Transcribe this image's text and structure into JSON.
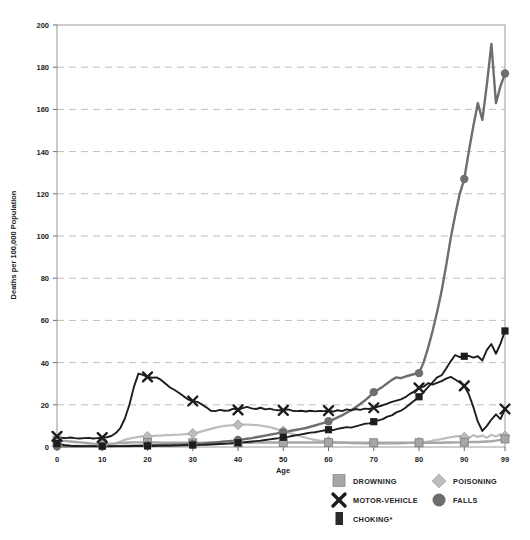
{
  "chart_data": {
    "type": "line",
    "title": "",
    "xlabel": "Age",
    "ylabel": "Deaths per 100,000 Population",
    "xlim": [
      0,
      99
    ],
    "ylim": [
      0,
      200
    ],
    "xticks": [
      0,
      10,
      20,
      30,
      40,
      50,
      60,
      70,
      80,
      90,
      99
    ],
    "yticks": [
      0,
      20,
      40,
      60,
      80,
      100,
      120,
      140,
      160,
      180,
      200
    ],
    "grid": "horizontal-dashed",
    "legend_position": "bottom",
    "x": [
      0,
      1,
      2,
      3,
      4,
      5,
      6,
      7,
      8,
      9,
      10,
      11,
      12,
      13,
      14,
      15,
      16,
      17,
      18,
      19,
      20,
      21,
      22,
      23,
      24,
      25,
      26,
      27,
      28,
      29,
      30,
      31,
      32,
      33,
      34,
      35,
      36,
      37,
      38,
      39,
      40,
      41,
      42,
      43,
      44,
      45,
      46,
      47,
      48,
      49,
      50,
      51,
      52,
      53,
      54,
      55,
      56,
      57,
      58,
      59,
      60,
      61,
      62,
      63,
      64,
      65,
      66,
      67,
      68,
      69,
      70,
      71,
      72,
      73,
      74,
      75,
      76,
      77,
      78,
      79,
      80,
      81,
      82,
      83,
      84,
      85,
      86,
      87,
      88,
      89,
      90,
      91,
      92,
      93,
      94,
      95,
      96,
      97,
      98,
      99
    ],
    "series": [
      {
        "name": "DROWNING",
        "marker": "square",
        "color": "#a6a6a6",
        "marker_ages": [
          0,
          10,
          20,
          30,
          40,
          50,
          60,
          70,
          80,
          90,
          99
        ],
        "values": [
          3.2,
          3.0,
          2.8,
          2.6,
          2.4,
          2.2,
          2.0,
          1.8,
          1.6,
          1.5,
          1.5,
          1.5,
          1.6,
          1.7,
          1.9,
          2.0,
          2.1,
          2.2,
          2.2,
          2.2,
          2.2,
          2.1,
          2.1,
          2.0,
          2.0,
          2.0,
          2.0,
          2.0,
          2.0,
          2.0,
          2.0,
          2.0,
          2.0,
          2.0,
          2.0,
          2.0,
          2.0,
          2.0,
          2.0,
          2.0,
          2.0,
          2.0,
          2.0,
          2.0,
          2.1,
          2.1,
          2.1,
          2.1,
          2.1,
          2.1,
          2.1,
          2.1,
          2.1,
          2.1,
          2.1,
          2.1,
          2.1,
          2.1,
          2.1,
          2.1,
          2.1,
          2.1,
          2.1,
          2.1,
          2.1,
          2.0,
          2.0,
          2.0,
          2.0,
          2.0,
          2.0,
          2.0,
          2.0,
          2.0,
          2.0,
          2.0,
          2.0,
          2.0,
          2.0,
          2.0,
          2.0,
          2.0,
          2.0,
          2.0,
          2.0,
          2.0,
          2.1,
          2.1,
          2.2,
          2.2,
          2.3,
          2.3,
          2.4,
          2.4,
          2.5,
          2.6,
          2.7,
          3.0,
          3.4,
          3.8
        ]
      },
      {
        "name": "MOTOR-VEHICLE",
        "marker": "x",
        "color": "#1d1d1d",
        "marker_ages": [
          0,
          10,
          20,
          30,
          40,
          50,
          60,
          70,
          80,
          90,
          99
        ],
        "values": [
          5.0,
          4.4,
          4.2,
          4.5,
          4.2,
          4.0,
          4.2,
          4.3,
          4.0,
          4.2,
          4.4,
          4.6,
          5.2,
          6.6,
          9.0,
          13.5,
          20.0,
          28.5,
          34.8,
          34.2,
          33.2,
          32.8,
          33.0,
          31.8,
          30.0,
          28.2,
          27.0,
          25.6,
          24.0,
          22.5,
          21.8,
          21.4,
          20.2,
          18.8,
          17.2,
          17.0,
          17.6,
          17.2,
          17.3,
          18.2,
          17.6,
          18.4,
          19.0,
          18.3,
          18.0,
          18.6,
          17.8,
          18.2,
          17.6,
          17.4,
          17.4,
          17.8,
          17.2,
          17.0,
          17.2,
          16.8,
          17.2,
          16.9,
          17.1,
          17.0,
          17.2,
          16.8,
          17.4,
          17.0,
          17.8,
          17.4,
          18.0,
          17.6,
          18.2,
          18.0,
          18.6,
          19.2,
          19.8,
          20.6,
          21.4,
          22.0,
          22.6,
          23.6,
          25.2,
          26.4,
          28.0,
          28.6,
          30.2,
          29.6,
          30.4,
          31.2,
          32.4,
          33.2,
          32.0,
          30.6,
          29.0,
          25.0,
          19.0,
          12.0,
          7.6,
          10.0,
          13.0,
          15.5,
          13.2,
          18.0
        ]
      },
      {
        "name": "CHOKING*",
        "marker": "square-dark",
        "color": "#1d1d1d",
        "marker_ages": [
          0,
          10,
          20,
          30,
          40,
          50,
          60,
          70,
          80,
          90,
          99
        ],
        "values": [
          1.6,
          1.2,
          0.8,
          0.6,
          0.5,
          0.4,
          0.4,
          0.4,
          0.4,
          0.4,
          0.4,
          0.4,
          0.4,
          0.4,
          0.4,
          0.4,
          0.5,
          0.5,
          0.5,
          0.5,
          0.5,
          0.5,
          0.6,
          0.6,
          0.6,
          0.6,
          0.7,
          0.7,
          0.8,
          0.8,
          0.9,
          0.9,
          1.0,
          1.1,
          1.2,
          1.3,
          1.4,
          1.5,
          1.6,
          1.8,
          2.0,
          2.2,
          2.4,
          2.6,
          2.8,
          3.0,
          3.3,
          3.6,
          3.9,
          4.2,
          4.6,
          4.8,
          5.2,
          5.6,
          6.0,
          6.4,
          6.8,
          7.0,
          7.4,
          7.8,
          8.2,
          8.0,
          8.6,
          9.0,
          9.4,
          9.2,
          9.8,
          10.4,
          11.0,
          11.2,
          12.0,
          12.6,
          13.2,
          14.4,
          15.0,
          16.4,
          17.2,
          18.6,
          20.4,
          22.0,
          23.8,
          26.0,
          28.4,
          30.6,
          33.0,
          34.0,
          37.2,
          40.6,
          43.6,
          42.6,
          43.0,
          43.2,
          42.4,
          43.0,
          41.0,
          46.0,
          48.8,
          44.2,
          49.0,
          55.0
        ]
      },
      {
        "name": "POISONING",
        "marker": "diamond",
        "color": "#bdbdbd",
        "marker_ages": [
          0,
          10,
          20,
          30,
          40,
          50,
          60,
          70,
          80,
          90,
          99
        ],
        "values": [
          0.6,
          0.5,
          0.5,
          0.5,
          0.5,
          0.5,
          0.5,
          0.6,
          0.6,
          0.7,
          0.8,
          0.9,
          1.2,
          1.8,
          2.6,
          3.4,
          4.0,
          4.4,
          4.8,
          5.0,
          5.0,
          5.2,
          5.4,
          5.4,
          5.6,
          5.6,
          5.8,
          5.8,
          6.0,
          6.2,
          6.4,
          6.8,
          7.4,
          8.0,
          8.6,
          9.2,
          9.6,
          10.0,
          10.2,
          10.4,
          10.5,
          10.6,
          10.6,
          10.5,
          10.4,
          10.2,
          9.8,
          9.4,
          8.8,
          8.2,
          7.6,
          7.0,
          6.2,
          5.6,
          5.0,
          4.4,
          3.8,
          3.4,
          3.0,
          2.8,
          2.6,
          2.4,
          2.2,
          2.0,
          1.9,
          1.8,
          1.7,
          1.7,
          1.6,
          1.6,
          1.6,
          1.6,
          1.6,
          1.6,
          1.6,
          1.6,
          1.7,
          1.8,
          1.9,
          2.0,
          2.2,
          2.4,
          2.6,
          3.0,
          3.4,
          3.8,
          4.2,
          4.6,
          5.0,
          5.2,
          4.6,
          4.2,
          5.6,
          4.8,
          5.4,
          4.4,
          5.8,
          5.0,
          6.0,
          5.2
        ]
      },
      {
        "name": "FALLS",
        "marker": "circle",
        "color": "#6e6e6e",
        "marker_ages": [
          0,
          10,
          20,
          30,
          40,
          50,
          60,
          70,
          80,
          90,
          99
        ],
        "values": [
          0.4,
          0.3,
          0.3,
          0.3,
          0.3,
          0.3,
          0.3,
          0.3,
          0.3,
          0.3,
          0.3,
          0.3,
          0.3,
          0.4,
          0.4,
          0.5,
          0.5,
          0.6,
          0.6,
          0.7,
          0.8,
          0.8,
          0.9,
          0.9,
          1.0,
          1.0,
          1.1,
          1.1,
          1.2,
          1.3,
          1.4,
          1.5,
          1.6,
          1.8,
          2.0,
          2.2,
          2.4,
          2.6,
          2.8,
          3.0,
          3.3,
          3.6,
          3.9,
          4.2,
          4.6,
          5.0,
          5.4,
          5.8,
          6.2,
          6.6,
          7.0,
          7.4,
          7.8,
          8.2,
          8.6,
          9.0,
          9.6,
          10.2,
          10.8,
          11.4,
          12.2,
          13.0,
          14.0,
          15.0,
          16.2,
          17.4,
          18.8,
          20.4,
          22.0,
          23.8,
          26.0,
          27.2,
          28.6,
          30.2,
          31.8,
          33.0,
          32.6,
          33.4,
          34.0,
          34.6,
          35.0,
          40.0,
          47.0,
          55.0,
          64.0,
          74.0,
          86.0,
          99.0,
          110.0,
          120.0,
          127.0,
          140.0,
          152.0,
          163.0,
          155.0,
          172.0,
          191.0,
          163.0,
          171.0,
          177.0
        ]
      }
    ]
  },
  "axis": {
    "y_label": "Deaths per 100,000 Population",
    "x_label": "Age",
    "y_ticks": [
      "0",
      "20",
      "40",
      "60",
      "80",
      "100",
      "120",
      "140",
      "160",
      "180",
      "200"
    ],
    "x_ticks": [
      "0",
      "10",
      "20",
      "30",
      "40",
      "50",
      "60",
      "70",
      "80",
      "90",
      "99"
    ]
  },
  "legend": {
    "items": [
      {
        "label": "DROWNING",
        "marker": "square",
        "color": "#a6a6a6"
      },
      {
        "label": "POISONING",
        "marker": "diamond",
        "color": "#bdbdbd"
      },
      {
        "label": "MOTOR-VEHICLE",
        "marker": "x",
        "color": "#1d1d1d"
      },
      {
        "label": "FALLS",
        "marker": "circle",
        "color": "#6e6e6e"
      },
      {
        "label": "CHOKING*",
        "marker": "square-dark",
        "color": "#2a2a2a"
      }
    ]
  }
}
